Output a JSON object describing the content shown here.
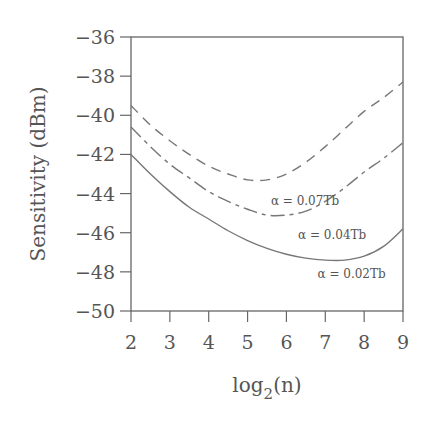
{
  "chart_data": {
    "type": "line",
    "title": "",
    "xlabel": "log2(n)",
    "xlabel_base": "log",
    "xlabel_sub": "2",
    "xlabel_tail": "(n)",
    "ylabel": "Sensitivity (dBm)",
    "xlim": [
      2,
      9
    ],
    "ylim": [
      -50,
      -36
    ],
    "xticks": [
      2,
      3,
      4,
      5,
      6,
      7,
      8,
      9
    ],
    "yticks": [
      -36,
      -38,
      -40,
      -42,
      -44,
      -46,
      -48,
      -50
    ],
    "xtick_labels": [
      "2",
      "3",
      "4",
      "5",
      "6",
      "7",
      "8",
      "9"
    ],
    "ytick_labels": [
      "−36",
      "−38",
      "−40",
      "−42",
      "−44",
      "−46",
      "−48",
      "−50"
    ],
    "grid": false,
    "legend": "inline annotations",
    "series": [
      {
        "name": "α = 0.07Tb",
        "style": "dashed",
        "x": [
          2,
          2.5,
          3,
          3.5,
          4,
          4.5,
          5,
          5.5,
          6,
          6.5,
          7,
          7.5,
          8,
          8.5,
          9
        ],
        "values": [
          -39.5,
          -40.5,
          -41.3,
          -42.0,
          -42.6,
          -43.0,
          -43.3,
          -43.3,
          -43.0,
          -42.4,
          -41.6,
          -40.7,
          -39.8,
          -39.1,
          -38.3
        ]
      },
      {
        "name": "α = 0.04Tb",
        "style": "dashdot",
        "x": [
          2,
          2.5,
          3,
          3.5,
          4,
          4.5,
          5,
          5.5,
          6,
          6.5,
          7,
          7.5,
          8,
          8.5,
          9
        ],
        "values": [
          -40.6,
          -41.6,
          -42.5,
          -43.2,
          -43.9,
          -44.4,
          -44.8,
          -45.1,
          -45.1,
          -44.9,
          -44.4,
          -43.7,
          -42.9,
          -42.2,
          -41.4
        ]
      },
      {
        "name": "α = 0.02Tb",
        "style": "solid",
        "x": [
          2,
          2.5,
          3,
          3.5,
          4,
          4.5,
          5,
          5.5,
          6,
          6.5,
          7,
          7.5,
          8,
          8.5,
          9
        ],
        "values": [
          -42.0,
          -43.0,
          -43.9,
          -44.7,
          -45.3,
          -45.9,
          -46.4,
          -46.8,
          -47.1,
          -47.3,
          -47.4,
          -47.4,
          -47.2,
          -46.7,
          -45.8
        ]
      }
    ],
    "annotations": [
      {
        "text": "α  =  0.07Tb",
        "x": 5.6,
        "y": -44.6
      },
      {
        "text": "α  =  0.04Tb",
        "x": 6.3,
        "y": -46.3
      },
      {
        "text": "α  =  0.02Tb",
        "x": 6.8,
        "y": -48.3
      }
    ]
  }
}
